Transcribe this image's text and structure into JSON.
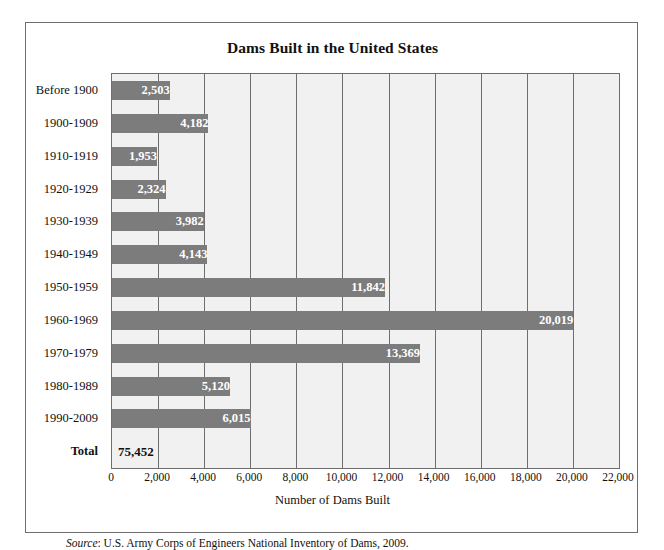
{
  "chart_data": {
    "type": "bar",
    "orientation": "horizontal",
    "title": "Dams Built in the United States",
    "xlabel": "Number of Dams Built",
    "ylabel": "",
    "xlim": [
      0,
      22000
    ],
    "xticks": [
      "0",
      "2,000",
      "4,000",
      "6,000",
      "8,000",
      "10,000",
      "12,000",
      "14,000",
      "16,000",
      "18,000",
      "20,000",
      "22,000"
    ],
    "xtick_values": [
      0,
      2000,
      4000,
      6000,
      8000,
      10000,
      12000,
      14000,
      16000,
      18000,
      20000,
      22000
    ],
    "grid": "vertical",
    "legend": "none",
    "bar_color": "#7c7c7c",
    "plot_background": "#f1f1f1",
    "categories": [
      "Before 1900",
      "1900-1909",
      "1910-1919",
      "1920-1929",
      "1930-1939",
      "1940-1949",
      "1950-1959",
      "1960-1969",
      "1970-1979",
      "1980-1989",
      "1990-2009",
      "Total"
    ],
    "values": [
      2503,
      4182,
      1953,
      2324,
      3982,
      4143,
      11842,
      20019,
      13369,
      5120,
      6015,
      75452
    ],
    "value_labels": [
      "2,503",
      "4,182",
      "1,953",
      "2,324",
      "3,982",
      "4,143",
      "11,842",
      "20,019",
      "13,369",
      "5,120",
      "6,015",
      "75,452"
    ],
    "total_row_index": 11,
    "total_row_has_bar": false,
    "annotations": []
  },
  "source": {
    "prefix": "Source",
    "text": ": U.S. Army Corps of Engineers National Inventory of Dams, 2009."
  }
}
